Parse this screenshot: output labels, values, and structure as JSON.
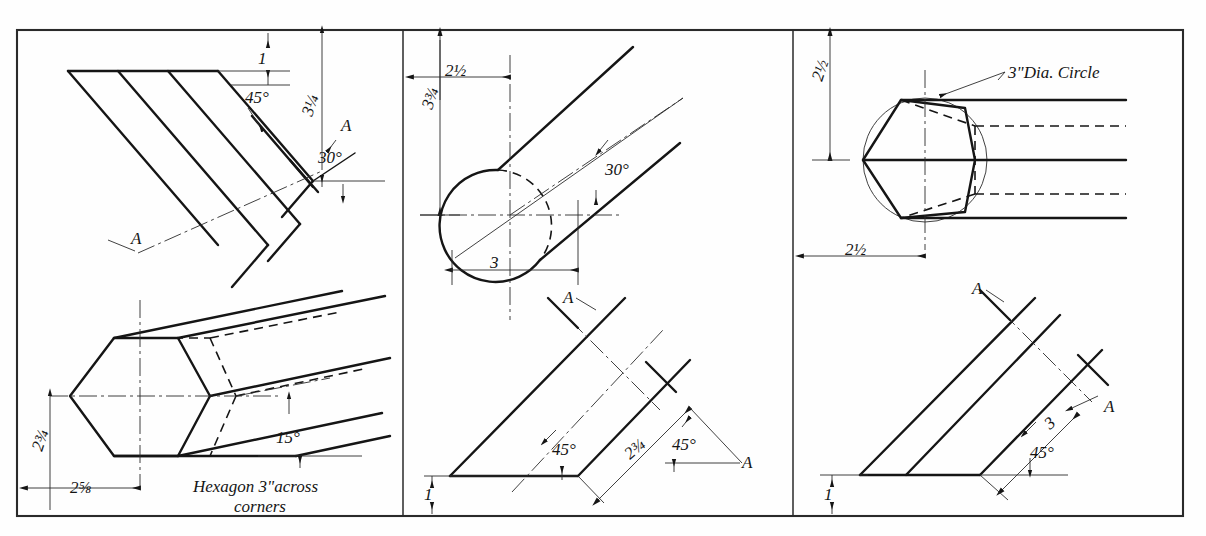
{
  "sheet": {
    "title": "Shaft End Cutting Plate - Three Views",
    "background_color": "#fefefe",
    "ink_color": "#151515",
    "border_color": "#2a2a2a",
    "panels": 3
  },
  "panel_left": {
    "name": "hexagonal-bar-panel",
    "upper_view": {
      "name": "hex-bar-oblique-upper",
      "labels": {
        "dim_small_top": "1",
        "angle_45": "45°",
        "dim_vertical": "3¼",
        "angle_30": "30°",
        "section_mark_upper": "A",
        "section_mark_lower": "A"
      }
    },
    "lower_view": {
      "name": "hex-bar-end-view-lower",
      "labels": {
        "dim_vertical": "2¾",
        "dim_horizontal": "2⅝",
        "angle_15": "15°",
        "note_line1": "Hexagon 3\"across",
        "note_line2": "corners"
      }
    }
  },
  "panel_middle": {
    "name": "round-bar-panel",
    "upper_view": {
      "name": "round-bar-end-view",
      "labels": {
        "dim_horizontal_top": "2½",
        "dim_vertical": "3¾",
        "dim_horizontal_bottom": "3",
        "angle_30": "30°"
      }
    },
    "lower_view": {
      "name": "round-bar-section-view",
      "labels": {
        "section_mark_upper": "A",
        "angle_45_left": "45°",
        "dim_diagonal": "2¾",
        "angle_45_right": "45°",
        "section_mark_right": "A",
        "dim_small_bottom": "1"
      }
    }
  },
  "panel_right": {
    "name": "hex-in-circle-panel",
    "upper_view": {
      "name": "hexagon-in-circle-view",
      "labels": {
        "dim_vertical": "2½",
        "dim_horizontal": "2½",
        "note_circle": "3\"Dia. Circle"
      }
    },
    "lower_view": {
      "name": "angled-bar-section-view",
      "labels": {
        "section_mark_upper": "A",
        "section_mark_right": "A",
        "dim_diagonal": "3",
        "angle_45": "45°",
        "dim_small_bottom": "1"
      }
    }
  },
  "drawing_data": {
    "type": "technical-drawing",
    "views": 6,
    "dimensions_listed": [
      "1",
      "3¼",
      "2¾",
      "2⅝",
      "2½",
      "3¾",
      "3",
      "3\""
    ],
    "angles_listed": [
      "45°",
      "30°",
      "15°",
      "30°",
      "45°",
      "45°",
      "45°"
    ],
    "section_labels": [
      "A",
      "A",
      "A",
      "A",
      "A",
      "A"
    ],
    "notes": [
      "Hexagon 3\"across corners",
      "3\"Dia. Circle"
    ]
  }
}
